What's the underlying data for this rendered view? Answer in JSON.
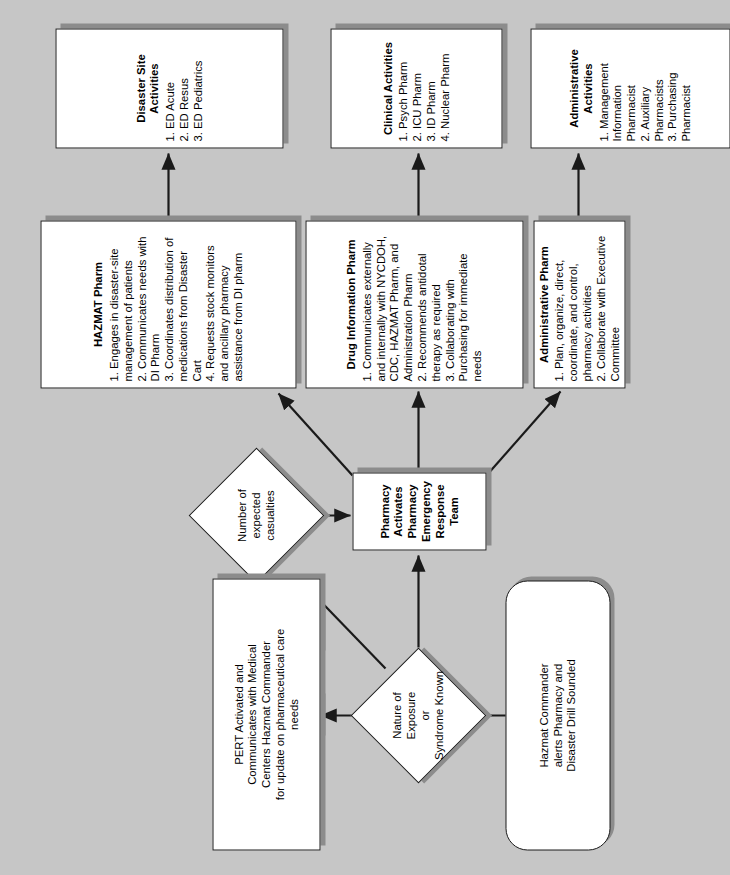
{
  "diagram": {
    "background_color": "#c6c6c6",
    "node_fill": "#ffffff",
    "node_border": "#1a1a1a",
    "shadow_color": "#8c8c8c"
  },
  "nodes": {
    "start": {
      "shape": "terminator",
      "lines": [
        "Hazmat Commander",
        "alerts Pharmacy and",
        "Disaster Drill Sounded"
      ]
    },
    "decision_exposure": {
      "shape": "diamond",
      "lines": [
        "Nature of Exposure",
        "or",
        "Syndrome Known"
      ]
    },
    "decision_casualties": {
      "shape": "diamond",
      "lines": [
        "Number of",
        "expected casualties"
      ]
    },
    "pert": {
      "shape": "process",
      "lines": [
        "PERT Activated and",
        "Communicates with Medical",
        "Centers Hazmat Commander",
        "for update on pharmaceutical care",
        "needs"
      ]
    },
    "pert_team": {
      "shape": "process",
      "lines": [
        "Pharmacy Activates",
        "Pharmacy Emergency Response",
        "Team"
      ]
    },
    "hazmat_pharm": {
      "shape": "process",
      "title": "HAZMAT Pharm",
      "items": [
        "1. Engages in disaster-site management of patients",
        "2. Communicates needs with DI Pharm",
        "3. Coordinates distribution of medications from Disaster Cart",
        "4. Requests stock monitors and ancillary pharmacy assistance from DI pharm"
      ]
    },
    "drug_info_pharm": {
      "shape": "process",
      "title": "Drug Information Pharm",
      "items": [
        "1. Communicates externally and internally with NYCDOH, CDC, HAZMAT Pharm, and Administration Pharm",
        "2. Recommends antidotal therapy as required",
        "3. Collaborating with Purchasing for immediate needs"
      ]
    },
    "admin_pharm": {
      "shape": "process",
      "title": "Administrative Pharm",
      "items": [
        "1. Plan, organize, direct, coordinate, and control, pharmacy activities",
        "2. Collaborate with Executive Committee"
      ]
    },
    "disaster_site_activities": {
      "shape": "process",
      "title": "Disaster Site Activities",
      "items": [
        "1. ED Acute",
        "2. ED Resus",
        "3. ED Pediatrics"
      ]
    },
    "clinical_activities": {
      "shape": "process",
      "title": "Clinical Activities",
      "items": [
        "1. Psych Pharm",
        "2. ICU Pharm",
        "3. ID Pharm",
        "4. Nuclear Pharm"
      ]
    },
    "administrative_activities": {
      "shape": "process",
      "title": "Administrative Activities",
      "items": [
        "1. Management Information Pharmacist",
        "2. Auxiliary Pharmacists",
        "3. Purchasing Pharmacist"
      ]
    }
  },
  "edge_labels": {
    "no": "NO",
    "yes": "Yes"
  }
}
